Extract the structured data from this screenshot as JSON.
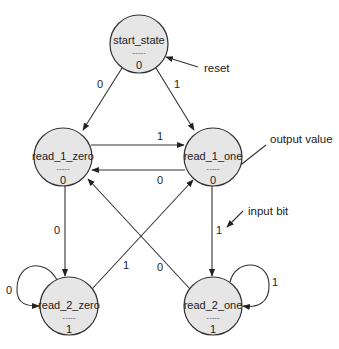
{
  "diagram": {
    "type": "finite-state-machine",
    "colors": {
      "state_fill": "#e6e6e6",
      "stroke": "#333333",
      "text": "#222222",
      "background": "#ffffff"
    },
    "states": [
      {
        "id": "start_state",
        "name": "start_state",
        "separator": "-----",
        "output": "0",
        "cx": 139,
        "cy": 44,
        "r": 29
      },
      {
        "id": "read_1_zero",
        "name": "read_1_zero",
        "separator": "-----",
        "output": "0",
        "cx": 63,
        "cy": 157,
        "r": 29
      },
      {
        "id": "read_1_one",
        "name": "read_1_one",
        "separator": "-----",
        "output": "0",
        "cx": 213,
        "cy": 157,
        "r": 29
      },
      {
        "id": "read_2_zero",
        "name": "read_2_zero",
        "separator": "-----",
        "output": "1",
        "cx": 69,
        "cy": 306,
        "r": 29
      },
      {
        "id": "read_2_one",
        "name": "read_2_one",
        "separator": "-----",
        "output": "1",
        "cx": 213,
        "cy": 306,
        "r": 29
      }
    ],
    "transitions": [
      {
        "from": "start_state",
        "to": "read_1_zero",
        "input": "0"
      },
      {
        "from": "start_state",
        "to": "read_1_one",
        "input": "1"
      },
      {
        "from": "read_1_zero",
        "to": "read_1_one",
        "input": "1"
      },
      {
        "from": "read_1_one",
        "to": "read_1_zero",
        "input": "0"
      },
      {
        "from": "read_1_zero",
        "to": "read_2_zero",
        "input": "0"
      },
      {
        "from": "read_1_one",
        "to": "read_2_one",
        "input": "1"
      },
      {
        "from": "read_2_zero",
        "to": "read_1_one",
        "input": "1"
      },
      {
        "from": "read_2_one",
        "to": "read_1_zero",
        "input": "0"
      },
      {
        "from": "read_2_zero",
        "to": "read_2_zero",
        "input": "0"
      },
      {
        "from": "read_2_one",
        "to": "read_2_one",
        "input": "1"
      }
    ],
    "annotations": {
      "reset": "reset",
      "output_value": "output value",
      "input_bit": "input bit"
    }
  }
}
